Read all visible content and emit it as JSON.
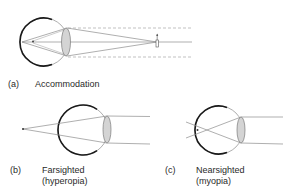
{
  "colors": {
    "eye_outline": "#1a1a1a",
    "eye_thin": "#8a8a8a",
    "ray": "#8c8c8c",
    "dashed": "#a8a8a8",
    "lens_fill": "#d4d4d4",
    "lens_stroke": "#7a7a7a",
    "text": "#2a2a2a"
  },
  "panels": [
    {
      "id": "a",
      "tag": "(a)",
      "title": "Accommodation",
      "subtitle": ""
    },
    {
      "id": "b",
      "tag": "(b)",
      "title": "Farsighted",
      "subtitle": "(hyperopia)"
    },
    {
      "id": "c",
      "tag": "(c)",
      "title": "Nearsighted",
      "subtitle": "(myopia)"
    }
  ]
}
